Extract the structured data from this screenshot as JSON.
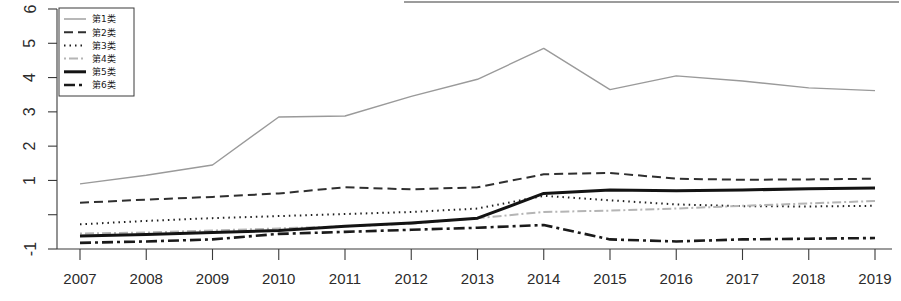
{
  "chart_data": {
    "type": "line",
    "title": "",
    "xlabel": "",
    "ylabel": "",
    "categories": [
      "2007",
      "2008",
      "2009",
      "2010",
      "2011",
      "2012",
      "2013",
      "2014",
      "2015",
      "2016",
      "2017",
      "2018",
      "2019"
    ],
    "x": [
      2007,
      2008,
      2009,
      2010,
      2011,
      2012,
      2013,
      2014,
      2015,
      2016,
      2017,
      2018,
      2019
    ],
    "ylim": [
      -1.35,
      6.25
    ],
    "xlim": [
      2006.7,
      2019.3
    ],
    "y_ticks": [
      -1,
      0,
      1,
      2,
      3,
      4,
      5,
      6
    ],
    "y_tick_labels": [
      "-1",
      "",
      "1",
      "2",
      "3",
      "4",
      "5",
      "6"
    ],
    "grid": false,
    "legend_position": "top-left",
    "series": [
      {
        "name": "第1类",
        "style": "solid",
        "color": "#9a9a9a",
        "width": 1.4,
        "dash": "none",
        "values": [
          0.9,
          1.15,
          1.45,
          2.85,
          2.88,
          3.45,
          3.95,
          4.85,
          3.65,
          4.05,
          3.9,
          3.7,
          3.62
        ]
      },
      {
        "name": "第2类",
        "style": "dashed",
        "color": "#2f2f2f",
        "width": 2.0,
        "dash": "9,5",
        "values": [
          0.35,
          0.44,
          0.52,
          0.62,
          0.8,
          0.74,
          0.8,
          1.18,
          1.22,
          1.05,
          1.02,
          1.03,
          1.05
        ]
      },
      {
        "name": "第3类",
        "style": "dotted",
        "color": "#1e1e1e",
        "width": 2.0,
        "dash": "1.5,4",
        "values": [
          -0.28,
          -0.18,
          -0.1,
          -0.04,
          0.02,
          0.08,
          0.18,
          0.55,
          0.42,
          0.3,
          0.25,
          0.24,
          0.26
        ]
      },
      {
        "name": "第4类",
        "style": "dashdot-light",
        "color": "#b5b5b5",
        "width": 2.0,
        "dash": "2,3,9,3",
        "values": [
          -0.55,
          -0.52,
          -0.46,
          -0.4,
          -0.34,
          -0.26,
          -0.1,
          0.08,
          0.12,
          0.18,
          0.26,
          0.33,
          0.4
        ]
      },
      {
        "name": "第5类",
        "style": "solid-bold",
        "color": "#131313",
        "width": 3.0,
        "dash": "none",
        "values": [
          -0.62,
          -0.58,
          -0.52,
          -0.46,
          -0.34,
          -0.24,
          -0.1,
          0.62,
          0.72,
          0.7,
          0.72,
          0.76,
          0.78
        ]
      },
      {
        "name": "第6类",
        "style": "dashdot-bold",
        "color": "#1a1a1a",
        "width": 2.6,
        "dash": "11,4,3,4",
        "values": [
          -0.82,
          -0.78,
          -0.72,
          -0.56,
          -0.5,
          -0.44,
          -0.38,
          -0.3,
          -0.72,
          -0.78,
          -0.72,
          -0.7,
          -0.68
        ]
      }
    ]
  },
  "legend": {
    "items": [
      {
        "label": "第1类"
      },
      {
        "label": "第2类"
      },
      {
        "label": "第3类"
      },
      {
        "label": "第4类"
      },
      {
        "label": "第5类"
      },
      {
        "label": "第6类"
      }
    ]
  },
  "axes": {
    "x_tick_labels": [
      "2007",
      "2008",
      "2009",
      "2010",
      "2011",
      "2012",
      "2013",
      "2014",
      "2015",
      "2016",
      "2017",
      "2018",
      "2019"
    ],
    "y_tick_labels": [
      "6",
      "5",
      "4",
      "3",
      "2",
      "1",
      "",
      "-1"
    ]
  }
}
